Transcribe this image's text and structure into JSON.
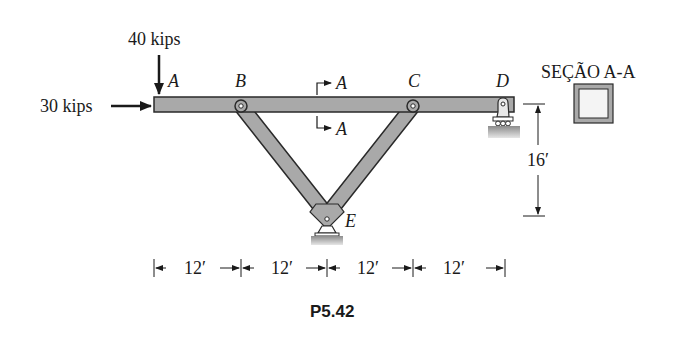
{
  "figure": {
    "caption": "P5.42",
    "section_title": "SEÇÃO A-A",
    "loads": {
      "vertical": "40 kips",
      "horizontal": "30 kips"
    },
    "points": {
      "a": "A",
      "b": "B",
      "c": "C",
      "d": "D",
      "e": "E"
    },
    "section_markers": {
      "top": "A",
      "bottom": "A"
    },
    "dimensions": {
      "height": "16′",
      "spans": [
        "12′",
        "12′",
        "12′",
        "12′"
      ]
    },
    "colors": {
      "member_fill": "#a9a9a9",
      "outline": "#2a2a2a",
      "ground": "#9a9a9a"
    }
  }
}
